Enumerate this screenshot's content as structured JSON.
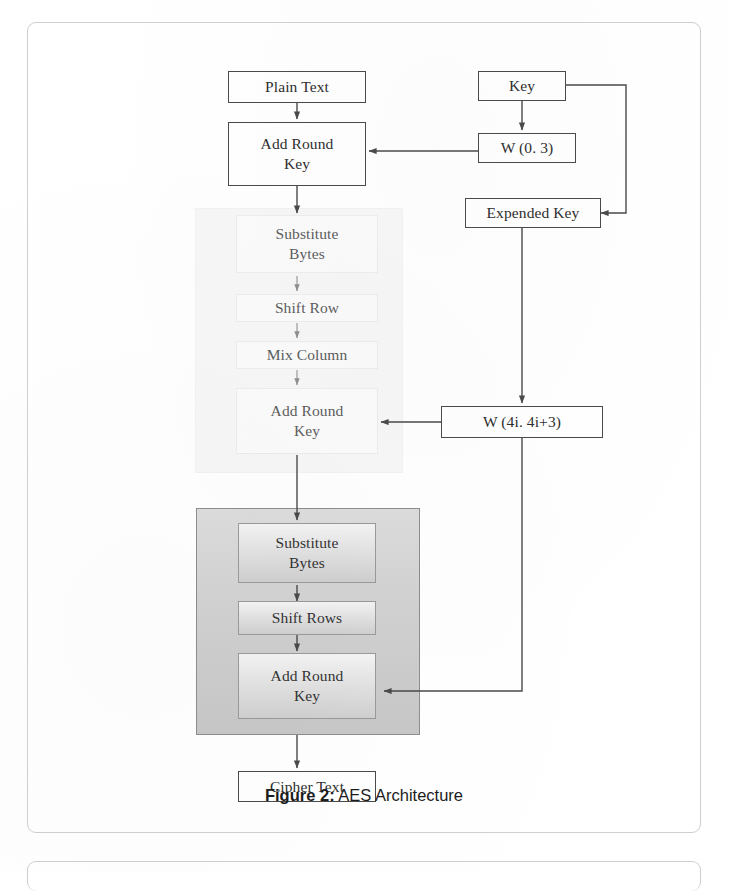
{
  "figure": {
    "caption_label": "Figure 2:",
    "caption_text": " AES Architecture"
  },
  "diagram": {
    "type": "flowchart",
    "title": "AES Architecture",
    "nodes": {
      "plain_text": "Plain Text",
      "add_round_key_initial": "Add Round\nKey",
      "key": "Key",
      "w_0_3": "W (0. 3)",
      "expended_key": "Expended Key",
      "w_4i": "W (4i. 4i+3)",
      "round_substitute_bytes": "Substitute\nBytes",
      "round_shift_row": "Shift Row",
      "round_mix_column": "Mix Column",
      "round_add_round_key": "Add Round\nKey",
      "final_substitute_bytes": "Substitute\nBytes",
      "final_shift_rows": "Shift Rows",
      "final_add_round_key": "Add Round\nKey",
      "cipher_text": "Cipher Text"
    },
    "groups": {
      "normal_round": "normal-round-group",
      "final_round": "final-round-group"
    },
    "edges": [
      {
        "from": "plain_text",
        "to": "add_round_key_initial"
      },
      {
        "from": "key",
        "to": "w_0_3"
      },
      {
        "from": "key",
        "to": "expended_key"
      },
      {
        "from": "w_0_3",
        "to": "add_round_key_initial"
      },
      {
        "from": "add_round_key_initial",
        "to": "round_substitute_bytes"
      },
      {
        "from": "round_substitute_bytes",
        "to": "round_shift_row"
      },
      {
        "from": "round_shift_row",
        "to": "round_mix_column"
      },
      {
        "from": "round_mix_column",
        "to": "round_add_round_key"
      },
      {
        "from": "expended_key",
        "to": "w_4i"
      },
      {
        "from": "w_4i",
        "to": "round_add_round_key"
      },
      {
        "from": "round_add_round_key",
        "to": "final_substitute_bytes"
      },
      {
        "from": "final_substitute_bytes",
        "to": "final_shift_rows"
      },
      {
        "from": "final_shift_rows",
        "to": "final_add_round_key"
      },
      {
        "from": "w_4i",
        "to": "final_add_round_key"
      },
      {
        "from": "final_add_round_key",
        "to": "cipher_text"
      }
    ]
  },
  "colors": {
    "page_background": "#ffffff",
    "panel_border": "#cfcfcf",
    "node_border": "#4a4a4a",
    "node_text": "#2e2e2e",
    "light_group_fill": "#f7f7f7",
    "dark_group_fill": "#d2d2d2",
    "shaded_node_fill": "#e3e3e3",
    "connector": "#4a4a4a",
    "caption_text": "#1d1d1d"
  }
}
